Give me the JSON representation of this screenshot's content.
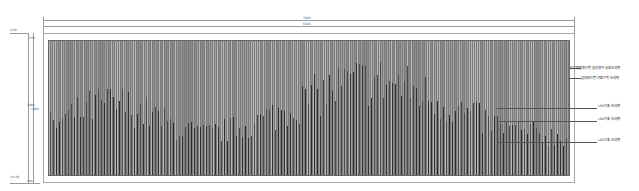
{
  "drawing": {
    "dimensions": {
      "overall_width": "7000",
      "inner_width": "6440",
      "height_left": "1900",
      "height_inner": "1800",
      "top_elevation": "4.80",
      "bottom_elevation": "±0.00",
      "side_small_top": "250",
      "side_small_bottom": "100"
    },
    "annotations": [
      "仿古铜色铝方管 竖向排列 规格见说明",
      "竖向铝方管 间距不等 见说明",
      "LED灯条 见说明",
      "LED灯条 见说明",
      "LED灯条 见说明"
    ],
    "colors": {
      "panel_base": "#7a7a7a",
      "bar_light": "#b8b8b8",
      "bar_mid": "#8c8c8c",
      "bar_dark": "#2e2e2e",
      "frame": "#a8a8a8"
    }
  }
}
